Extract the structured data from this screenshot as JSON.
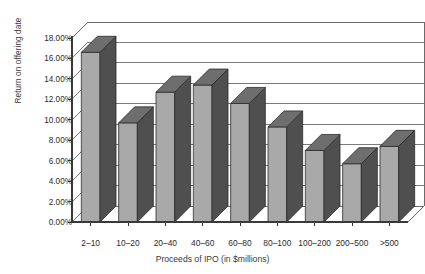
{
  "chart_data": {
    "type": "bar",
    "title": "",
    "subtitle": "",
    "xlabel": "Proceeds of IPO (in $millions)",
    "ylabel": "Return on offering date",
    "categories": [
      "2–10",
      "10–20",
      "20–40",
      "40–60",
      "60–80",
      "80–100",
      "100–200",
      "200–500",
      ">500"
    ],
    "values": [
      16.6,
      9.7,
      12.7,
      13.4,
      11.6,
      9.3,
      7.0,
      5.7,
      7.4
    ],
    "value_labels": [
      "16.60%",
      "9.70%",
      "12.70%",
      "13.40%",
      "11.60%",
      "9.30%",
      "7.00%",
      "5.70%",
      "7.40%"
    ],
    "ylim": [
      0,
      18
    ],
    "ytick_values": [
      0,
      2,
      4,
      6,
      8,
      10,
      12,
      14,
      16,
      18
    ],
    "ytick_labels": [
      "0.00%",
      "2.00%",
      "4.00%",
      "6.00%",
      "8.00%",
      "10.00%",
      "12.00%",
      "14.00%",
      "16.00%",
      "18.00%"
    ],
    "grid": true,
    "grid_axis": "y",
    "legend": false,
    "legend_position": "none",
    "style": "3d-bar",
    "colors": {
      "bar_face": "#a9a9a9",
      "bar_side": "#4f4f4f",
      "bar_top": "#6e6e6e",
      "bar_outline": "#2b2b2b",
      "grid_line": "#6b6b6b",
      "axis_line": "#3a3a3a",
      "background": "#ffffff",
      "text": "#2b2b2b"
    }
  }
}
